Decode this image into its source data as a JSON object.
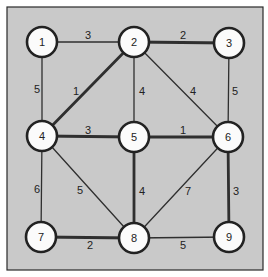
{
  "diagram": {
    "type": "weighted-undirected-graph",
    "colors": {
      "background": "#c9c9c9",
      "node_fill": "#fbfbfb",
      "stroke": "#222222"
    },
    "nodes": [
      {
        "id": "1",
        "label": "1",
        "x": 42,
        "y": 42
      },
      {
        "id": "2",
        "label": "2",
        "x": 134,
        "y": 42
      },
      {
        "id": "3",
        "label": "3",
        "x": 229,
        "y": 43
      },
      {
        "id": "4",
        "label": "4",
        "x": 42,
        "y": 136
      },
      {
        "id": "5",
        "label": "5",
        "x": 134,
        "y": 137
      },
      {
        "id": "6",
        "label": "6",
        "x": 228,
        "y": 137
      },
      {
        "id": "7",
        "label": "7",
        "x": 41,
        "y": 237
      },
      {
        "id": "8",
        "label": "8",
        "x": 134,
        "y": 238
      },
      {
        "id": "9",
        "label": "9",
        "x": 229,
        "y": 237
      }
    ],
    "edges": [
      {
        "from": "1",
        "to": "2",
        "weight": "3",
        "thick": false,
        "lx": 88,
        "ly": 35
      },
      {
        "from": "2",
        "to": "3",
        "weight": "2",
        "thick": true,
        "lx": 183,
        "ly": 35
      },
      {
        "from": "1",
        "to": "4",
        "weight": "5",
        "thick": false,
        "lx": 37,
        "ly": 89
      },
      {
        "from": "2",
        "to": "4",
        "weight": "1",
        "thick": true,
        "lx": 76,
        "ly": 91
      },
      {
        "from": "2",
        "to": "5",
        "weight": "4",
        "thick": false,
        "lx": 142,
        "ly": 91
      },
      {
        "from": "2",
        "to": "6",
        "weight": "4",
        "thick": false,
        "lx": 193,
        "ly": 91
      },
      {
        "from": "3",
        "to": "6",
        "weight": "5",
        "thick": false,
        "lx": 235,
        "ly": 91
      },
      {
        "from": "4",
        "to": "5",
        "weight": "3",
        "thick": true,
        "lx": 88,
        "ly": 130
      },
      {
        "from": "5",
        "to": "6",
        "weight": "1",
        "thick": true,
        "lx": 183,
        "ly": 130
      },
      {
        "from": "4",
        "to": "7",
        "weight": "6",
        "thick": false,
        "lx": 37,
        "ly": 189
      },
      {
        "from": "4",
        "to": "8",
        "weight": "5",
        "thick": false,
        "lx": 80,
        "ly": 190
      },
      {
        "from": "5",
        "to": "8",
        "weight": "4",
        "thick": true,
        "lx": 142,
        "ly": 191
      },
      {
        "from": "6",
        "to": "8",
        "weight": "7",
        "thick": false,
        "lx": 188,
        "ly": 191
      },
      {
        "from": "6",
        "to": "9",
        "weight": "3",
        "thick": true,
        "lx": 236,
        "ly": 191
      },
      {
        "from": "7",
        "to": "8",
        "weight": "2",
        "thick": true,
        "lx": 90,
        "ly": 245
      },
      {
        "from": "8",
        "to": "9",
        "weight": "5",
        "thick": false,
        "lx": 183,
        "ly": 245
      }
    ]
  }
}
